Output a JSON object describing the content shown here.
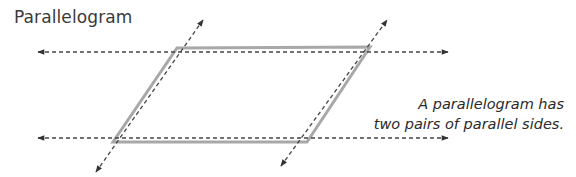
{
  "title": "Parallelogram",
  "caption": {
    "line1": "A parallelogram has",
    "line2": "two pairs of parallel sides."
  },
  "colors": {
    "shape_stroke": "#a8a8a8",
    "dashed_line": "#444444",
    "text": "#3a3a3a"
  },
  "shape": {
    "type": "parallelogram",
    "vertices": [
      [
        177,
        48
      ],
      [
        370,
        47
      ],
      [
        307,
        142
      ],
      [
        113,
        142
      ]
    ]
  },
  "lines": [
    {
      "name": "top-parallel-line",
      "x1": 38,
      "y1": 52,
      "x2": 448,
      "y2": 52
    },
    {
      "name": "bottom-parallel-line",
      "x1": 38,
      "y1": 138,
      "x2": 448,
      "y2": 138
    },
    {
      "name": "left-parallel-line",
      "x1": 96,
      "y1": 172,
      "x2": 203,
      "y2": 20
    },
    {
      "name": "right-parallel-line",
      "x1": 281,
      "y1": 166,
      "x2": 387,
      "y2": 20
    }
  ]
}
